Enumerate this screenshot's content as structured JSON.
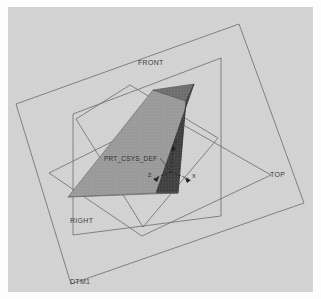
{
  "view": {
    "background_color": "#d2d2d2",
    "frame_color": "#fdfdfd",
    "edge_color": "#5a5a5a"
  },
  "datum_planes": [
    {
      "name": "FRONT",
      "label": "FRONT",
      "label_x": 138,
      "label_y": 58
    },
    {
      "name": "TOP",
      "label": "TOP",
      "label_x": 268,
      "label_y": 170
    },
    {
      "name": "RIGHT",
      "label": "RIGHT",
      "label_x": 70,
      "label_y": 216
    },
    {
      "name": "DTM1",
      "label": "DTM1",
      "label_x": 70,
      "label_y": 277
    }
  ],
  "coord_system": {
    "label": "PRT_CSYS_DEF",
    "label_x": 104,
    "label_y": 152,
    "origin_x": 163,
    "origin_y": 165,
    "axes": [
      {
        "name": "Y",
        "label": "Y",
        "label_x": 166,
        "label_y": 137
      },
      {
        "name": "X",
        "label": "X",
        "label_x": 183,
        "label_y": 170
      },
      {
        "name": "Z",
        "label": "Z",
        "label_x": 143,
        "label_y": 168
      }
    ]
  },
  "solid": {
    "name": "frustum",
    "faces": [
      {
        "name": "front-left-face",
        "color": "#9a9a9a"
      },
      {
        "name": "right-face",
        "color": "#414141"
      },
      {
        "name": "top-face",
        "color": "#6f6f6f"
      }
    ]
  }
}
